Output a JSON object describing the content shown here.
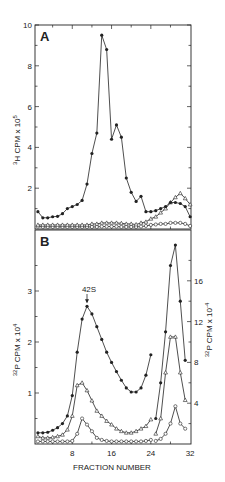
{
  "figure": {
    "panel_a_label": "A",
    "panel_b_label": "B",
    "xlabel": "FRACTION NUMBER",
    "annotation": "42S",
    "colors": {
      "ink": "#222222",
      "background": "#ffffff"
    }
  },
  "chart_data": [
    {
      "type": "line",
      "panel": "A",
      "title": "A",
      "xlabel": "",
      "ylabel": "3H CPM x 10^5",
      "xlim": [
        0,
        32
      ],
      "ylim": [
        0,
        10
      ],
      "yticks": [
        2,
        4,
        6,
        8,
        10
      ],
      "grid": false,
      "x": [
        1,
        2,
        3,
        4,
        5,
        6,
        7,
        8,
        9,
        10,
        11,
        12,
        13,
        14,
        15,
        16,
        17,
        18,
        19,
        20,
        21,
        22,
        23,
        24,
        25,
        26,
        27,
        28,
        29,
        30,
        31,
        32
      ],
      "series": [
        {
          "name": "filled circles",
          "marker": "filled-circle",
          "values": [
            0.85,
            0.55,
            0.55,
            0.6,
            0.62,
            0.75,
            1.0,
            1.1,
            1.2,
            1.4,
            2.2,
            3.7,
            4.7,
            9.5,
            8.8,
            4.4,
            5.1,
            4.5,
            2.5,
            1.8,
            1.35,
            1.6,
            0.85,
            0.85,
            0.9,
            1.0,
            1.1,
            1.3,
            1.3,
            1.25,
            1.1,
            0.6
          ]
        },
        {
          "name": "open triangles",
          "marker": "open-triangle",
          "values": [
            0.2,
            0.2,
            0.2,
            0.2,
            0.2,
            0.2,
            0.2,
            0.2,
            0.2,
            0.2,
            0.2,
            0.25,
            0.25,
            0.3,
            0.3,
            0.3,
            0.3,
            0.28,
            0.25,
            0.25,
            0.22,
            0.3,
            0.35,
            0.5,
            0.6,
            0.8,
            1.0,
            1.3,
            1.55,
            1.75,
            1.5,
            1.2
          ]
        },
        {
          "name": "open circles",
          "marker": "open-circle",
          "values": [
            0.12,
            0.1,
            0.1,
            0.1,
            0.1,
            0.1,
            0.1,
            0.1,
            0.1,
            0.1,
            0.1,
            0.1,
            0.1,
            0.12,
            0.12,
            0.12,
            0.12,
            0.1,
            0.1,
            0.1,
            0.1,
            0.12,
            0.15,
            0.2,
            0.22,
            0.25,
            0.25,
            0.3,
            0.3,
            0.3,
            0.25,
            0.15
          ]
        }
      ]
    },
    {
      "type": "line",
      "panel": "B",
      "title": "B",
      "xlabel": "FRACTION NUMBER",
      "ylabel": "32P CPM x 10^4",
      "ylabel_right": "32P CPM x 10^-4",
      "xlim": [
        0,
        32
      ],
      "xticks": [
        8,
        16,
        24,
        32
      ],
      "ylim": [
        0,
        4.2
      ],
      "yticks": [
        1,
        2,
        3
      ],
      "ylim_right": [
        0,
        21
      ],
      "yticks_right": [
        4,
        8,
        12,
        16
      ],
      "grid": false,
      "annotations": [
        {
          "text": "42S",
          "x": 11,
          "y": 2.7,
          "arrow": true
        }
      ],
      "segments": [
        {
          "axis": "left",
          "x": [
            1,
            2,
            3,
            4,
            5,
            6,
            7,
            8,
            9,
            10,
            11,
            12,
            13,
            14,
            15,
            16,
            17,
            18,
            19,
            20,
            21,
            22,
            23,
            24
          ],
          "series": [
            {
              "name": "filled circles",
              "marker": "filled-circle",
              "values": [
                0.22,
                0.22,
                0.23,
                0.27,
                0.32,
                0.4,
                0.55,
                0.95,
                1.8,
                2.45,
                2.7,
                2.55,
                2.3,
                2.05,
                1.8,
                1.6,
                1.42,
                1.25,
                1.1,
                1.02,
                1.02,
                1.1,
                1.35,
                1.75
              ]
            },
            {
              "name": "open triangles",
              "marker": "open-triangle",
              "values": [
                0.15,
                0.12,
                0.12,
                0.13,
                0.15,
                0.18,
                0.28,
                0.55,
                1.15,
                1.2,
                1.05,
                0.85,
                0.65,
                0.55,
                0.45,
                0.38,
                0.3,
                0.25,
                0.22,
                0.22,
                0.25,
                0.3,
                0.35,
                0.48
              ]
            },
            {
              "name": "open circles",
              "marker": "open-circle",
              "values": [
                0.05,
                0.05,
                0.05,
                0.05,
                0.05,
                0.05,
                0.05,
                0.06,
                0.2,
                0.5,
                0.38,
                0.25,
                0.12,
                0.08,
                0.06,
                0.05,
                0.05,
                0.05,
                0.05,
                0.05,
                0.05,
                0.05,
                0.06,
                0.08
              ]
            }
          ]
        },
        {
          "axis": "right",
          "x": [
            25,
            26,
            27,
            28,
            29,
            30,
            31
          ],
          "series": [
            {
              "name": "filled circles",
              "marker": "filled-circle",
              "values": [
                2.5,
                6,
                11,
                17.5,
                19.5,
                14,
                8.2
              ]
            },
            {
              "name": "open triangles",
              "marker": "open-triangle",
              "values": [
                1,
                2.5,
                7,
                10.5,
                10.5,
                7,
                4.3
              ]
            },
            {
              "name": "open circles",
              "marker": "open-circle",
              "values": [
                0.3,
                0.5,
                1,
                2,
                3.7,
                2,
                1.5
              ]
            }
          ]
        }
      ]
    }
  ]
}
